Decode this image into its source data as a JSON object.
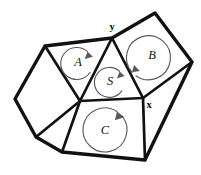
{
  "figure": {
    "background_color": "#ffffff",
    "stroke_color": "#111111",
    "arrow_color": "#5a5a5a",
    "width": 201,
    "height": 175
  },
  "vertices": {
    "y": {
      "label": "y",
      "x": 112,
      "y": 38,
      "label_x": 112,
      "label_y": 26
    },
    "x": {
      "label": "x",
      "x": 143,
      "y": 98,
      "label_x": 149,
      "label_y": 104
    },
    "center": {
      "x": 80,
      "y": 101
    },
    "left_top": {
      "x": 45,
      "y": 46
    },
    "left_far": {
      "x": 15,
      "y": 99
    },
    "left_bottom": {
      "x": 36,
      "y": 137
    },
    "bottom_left": {
      "x": 62,
      "y": 152
    },
    "bottom_right": {
      "x": 145,
      "y": 160
    },
    "top_right": {
      "x": 155,
      "y": 13
    },
    "far_right": {
      "x": 192,
      "y": 62
    }
  },
  "regions": [
    {
      "id": "region-a",
      "label": "A",
      "label_x": 78,
      "label_y": 62,
      "arc_cx": 78,
      "arc_cy": 63,
      "arc_r": 16,
      "points": "45,46 112,38 80,101"
    },
    {
      "id": "region-s",
      "label": "S",
      "label_x": 110,
      "label_y": 81,
      "arc_cx": 111,
      "arc_cy": 82,
      "arc_r": 15,
      "points": "112,38 143,98 80,101"
    },
    {
      "id": "region-b",
      "label": "B",
      "label_x": 152,
      "label_y": 55,
      "arc_cx": 150,
      "arc_cy": 57,
      "arc_r": 22,
      "points": "112,38 155,13 192,62 143,98"
    },
    {
      "id": "region-c",
      "label": "C",
      "label_x": 105,
      "label_y": 130,
      "arc_cx": 105,
      "arc_cy": 130,
      "arc_r": 22,
      "points": "80,101 143,98 145,160 62,152"
    }
  ],
  "faces": [
    {
      "id": "face-left-pentagon",
      "points": "45,46 80,101 36,137 15,99"
    },
    {
      "id": "face-lower-left-triangle",
      "points": "36,137 80,101 62,152"
    },
    {
      "id": "face-bottom-right-triangle",
      "points": "143,98 192,62 145,160"
    }
  ],
  "edges": {
    "outer": [
      "45,46 15,99 36,137 62,152 145,160 192,62 155,13 112,38 45,46"
    ],
    "inner": [
      "45,46 80,101",
      "80,101 112,38",
      "80,101 36,137",
      "80,101 62,152",
      "80,101 143,98",
      "112,38 143,98",
      "143,98 192,62",
      "143,98 145,160"
    ]
  }
}
